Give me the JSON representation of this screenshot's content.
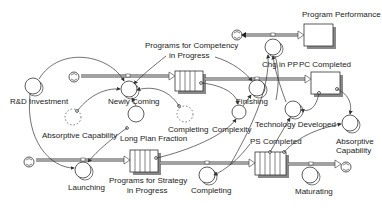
{
  "diagram": {
    "stocks": {
      "program_performance": "Program Performance",
      "pc_completed": "PC Completed",
      "programs_competency_line1": "Programs for Competency",
      "programs_competency_line2": "in Progress",
      "programs_strategy_line1": "Programs for Strategy",
      "programs_strategy_line2": "in Progress",
      "ps_completed": "PS Completed"
    },
    "flows": {
      "chg_in_pp": "Chg in PP",
      "newly_coming": "Newly Coming",
      "finishing": "Finishing",
      "launching": "Launching",
      "completing": "Completing",
      "maturating": "Maturating"
    },
    "auxiliaries": {
      "rd_investment": "R&D Investment",
      "absorptive_capability_left": "Absorptive Capability",
      "long_plan_fraction": "Long Plan Fraction",
      "completing_ghost": "Completing",
      "complexity": "Complexity",
      "technology_developed": "Technology Developed",
      "absorptive_capability_right_line1": "Absorptive",
      "absorptive_capability_right_line2": "Capability"
    }
  }
}
